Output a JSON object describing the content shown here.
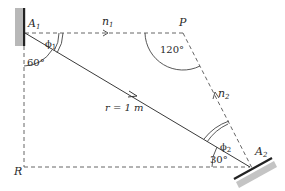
{
  "diagram": {
    "labels": {
      "a1": "A",
      "a1_sub": "1",
      "a2": "A",
      "a2_sub": "2",
      "p": "P",
      "r_point": "R",
      "n1": "n",
      "n1_sub": "1",
      "n2": "n",
      "n2_sub": "2",
      "phi1": "ϕ",
      "phi1_sub": "1",
      "phi2": "ϕ",
      "phi2_sub": "2",
      "angle_a1": "60°",
      "angle_p": "120°",
      "angle_a2": "30°",
      "distance": "r = 1 m"
    },
    "colors": {
      "line": "#3a3a3a",
      "dash": "#555555",
      "mirror_face": "#222222",
      "mirror_back": "#b8b8b8"
    }
  }
}
